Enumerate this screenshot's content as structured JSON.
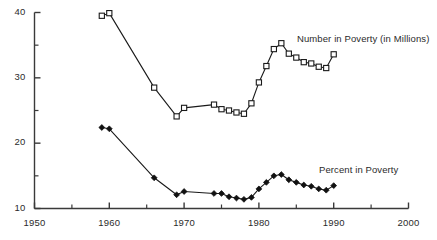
{
  "chart_data": {
    "type": "line",
    "title": "",
    "subtitle": "",
    "xlabel": "",
    "ylabel": "",
    "xlim": [
      1950,
      2000
    ],
    "ylim": [
      10,
      40
    ],
    "grid": false,
    "legend_position": "inline-annotation",
    "x_ticks_major": [
      1950,
      1960,
      1970,
      1980,
      1990,
      2000
    ],
    "x_ticks_minor": [
      1955,
      1965,
      1975,
      1985,
      1995
    ],
    "x_tick_labels": [
      "1950",
      "1960",
      "1970",
      "1980",
      "1990",
      "2000"
    ],
    "y_ticks_major": [
      10,
      20,
      30,
      40
    ],
    "y_ticks_minor": [
      15,
      25,
      35
    ],
    "y_tick_labels": [
      "10",
      "20",
      "30",
      "40"
    ],
    "series": [
      {
        "name": "Number in Poverty (in Millions)",
        "marker": "open-square",
        "annotation": "Number in Poverty (in Millions)",
        "x": [
          1959,
          1960,
          1966,
          1969,
          1970,
          1974,
          1975,
          1976,
          1977,
          1978,
          1979,
          1980,
          1981,
          1982,
          1983,
          1984,
          1985,
          1986,
          1987,
          1988,
          1989,
          1990
        ],
        "values": [
          39.5,
          39.9,
          28.5,
          24.1,
          25.4,
          25.9,
          25.2,
          25.0,
          24.7,
          24.5,
          26.1,
          29.3,
          31.8,
          34.4,
          35.3,
          33.7,
          33.1,
          32.4,
          32.2,
          31.7,
          31.5,
          33.6
        ]
      },
      {
        "name": "Percent in Poverty",
        "marker": "filled-diamond",
        "annotation": "Percent in Poverty",
        "x": [
          1959,
          1960,
          1966,
          1969,
          1970,
          1974,
          1975,
          1976,
          1977,
          1978,
          1979,
          1980,
          1981,
          1982,
          1983,
          1984,
          1985,
          1986,
          1987,
          1988,
          1989,
          1990
        ],
        "values": [
          22.4,
          22.2,
          14.7,
          12.1,
          12.6,
          12.3,
          12.3,
          11.8,
          11.6,
          11.4,
          11.7,
          13.0,
          14.0,
          15.0,
          15.2,
          14.4,
          14.0,
          13.6,
          13.4,
          13.0,
          12.8,
          13.5
        ]
      }
    ]
  },
  "annotations": {
    "number_in_poverty": "Number in Poverty (in Millions)",
    "percent_in_poverty": "Percent in Poverty"
  },
  "colors": {
    "axis": "#3a3a3a",
    "line": "#1a1a1a",
    "marker_fill": "#ffffff",
    "marker_edge": "#1a1a1a",
    "diamond_fill": "#111111",
    "text": "#2b2b2b",
    "background": "#ffffff"
  }
}
